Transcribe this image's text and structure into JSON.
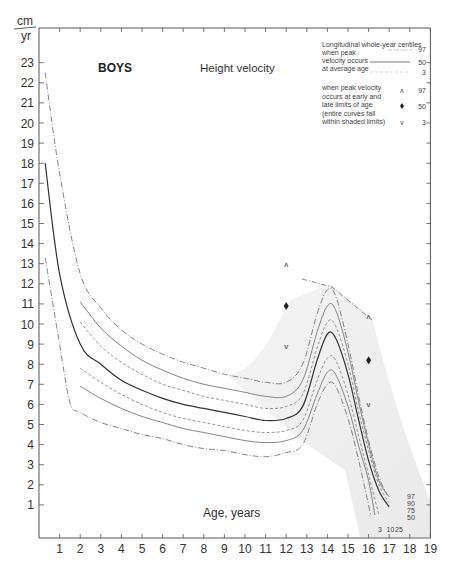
{
  "chart_data": {
    "type": "line",
    "title": "BOYS",
    "subtitle": "Height velocity",
    "xlabel": "Age, years",
    "ylabel_top": "cm",
    "ylabel_bottom": "yr",
    "xlim": [
      0,
      19
    ],
    "ylim": [
      0,
      23
    ],
    "x_ticks": [
      1,
      2,
      3,
      4,
      5,
      6,
      7,
      8,
      9,
      10,
      11,
      12,
      13,
      14,
      15,
      16,
      17,
      18,
      19
    ],
    "y_ticks": [
      1,
      2,
      3,
      4,
      5,
      6,
      7,
      8,
      9,
      10,
      11,
      12,
      13,
      14,
      15,
      16,
      17,
      18,
      19,
      20,
      21,
      22,
      23
    ],
    "grid": false,
    "legend": {
      "position": "top-right",
      "heading": "Longitudinal whole-year centiles",
      "group1_lines": [
        "when peak",
        "velocity occurs",
        "at average age"
      ],
      "group1_centiles": [
        "97",
        "50",
        "3"
      ],
      "group2_lines": [
        "when peak velocity",
        "occurs at early and",
        "late limits of age",
        "(entire curves fall",
        "within shaded limits)"
      ],
      "group2_markers": [
        {
          "symbol": "^",
          "centile": "97"
        },
        {
          "symbol": "♦",
          "centile": "50"
        },
        {
          "symbol": "v",
          "centile": "3"
        }
      ]
    },
    "curve_end_labels_right": [
      "97",
      "90",
      "75",
      "50"
    ],
    "curve_end_labels_bottom": [
      "3",
      "10",
      "25"
    ],
    "series": [
      {
        "name": "97th (average age)",
        "style": "dash-dot",
        "x": [
          0.3,
          1,
          2,
          3,
          4,
          5,
          6,
          7,
          8,
          9,
          10,
          11,
          12,
          12.8,
          13.5,
          14,
          14.4,
          15,
          15.5,
          16,
          16.5,
          16.9
        ],
        "y": [
          22.5,
          17.5,
          12.5,
          10.8,
          9.7,
          9.0,
          8.5,
          8.1,
          7.8,
          7.5,
          7.3,
          7.1,
          7.1,
          8.0,
          10.5,
          11.7,
          11.4,
          9.0,
          6.5,
          4.2,
          2.4,
          1.5
        ]
      },
      {
        "name": "90th",
        "style": "solid",
        "x": [
          2,
          3,
          4,
          5,
          6,
          7,
          8,
          9,
          10,
          11,
          12,
          12.8,
          13.5,
          14,
          14.4,
          15,
          15.5,
          16,
          16.5,
          17
        ],
        "y": [
          11.1,
          9.8,
          8.9,
          8.2,
          7.7,
          7.3,
          7.0,
          6.8,
          6.6,
          6.4,
          6.4,
          7.2,
          9.6,
          10.9,
          10.7,
          8.6,
          6.2,
          4.0,
          2.2,
          1.4
        ]
      },
      {
        "name": "75th",
        "style": "dashed",
        "x": [
          2,
          3,
          4,
          5,
          6,
          7,
          8,
          9,
          10,
          11,
          12,
          12.8,
          13.5,
          14,
          14.4,
          15,
          15.5,
          16,
          16.5,
          17
        ],
        "y": [
          10.1,
          8.9,
          8.1,
          7.5,
          7.0,
          6.7,
          6.4,
          6.2,
          6.0,
          5.8,
          5.9,
          6.5,
          8.8,
          10.1,
          9.9,
          8.0,
          5.7,
          3.7,
          2.0,
          1.1
        ]
      },
      {
        "name": "50th (average age)",
        "style": "solid-dark",
        "x": [
          0.3,
          1,
          2,
          3,
          4,
          5,
          6,
          7,
          8,
          9,
          10,
          11,
          12,
          12.8,
          13.5,
          14,
          14.4,
          15,
          15.5,
          16,
          16.5,
          17
        ],
        "y": [
          18.0,
          12.5,
          9.0,
          8.0,
          7.2,
          6.7,
          6.3,
          6.0,
          5.8,
          5.6,
          5.4,
          5.2,
          5.3,
          5.9,
          8.2,
          9.5,
          9.3,
          7.5,
          5.3,
          3.2,
          1.7,
          0.9
        ]
      },
      {
        "name": "25th",
        "style": "dashed",
        "x": [
          2,
          3,
          4,
          5,
          6,
          7,
          8,
          9,
          10,
          11,
          12,
          12.8,
          13.5,
          14,
          14.4,
          15,
          15.5,
          16,
          16.5
        ],
        "y": [
          7.8,
          7.1,
          6.5,
          6.0,
          5.6,
          5.3,
          5.1,
          4.9,
          4.7,
          4.6,
          4.7,
          5.2,
          7.2,
          8.3,
          8.2,
          6.5,
          4.5,
          2.5,
          0.5
        ]
      },
      {
        "name": "10th",
        "style": "solid",
        "x": [
          2,
          3,
          4,
          5,
          6,
          7,
          8,
          9,
          10,
          11,
          12,
          12.8,
          13.5,
          14,
          14.4,
          15,
          15.5,
          16,
          16.3
        ],
        "y": [
          6.9,
          6.3,
          5.8,
          5.4,
          5.1,
          4.8,
          4.6,
          4.4,
          4.2,
          4.1,
          4.2,
          4.7,
          6.5,
          7.6,
          7.5,
          5.9,
          4.0,
          2.2,
          0.5
        ]
      },
      {
        "name": "3rd (average age)",
        "style": "dash-dot",
        "x": [
          0.3,
          1,
          1.5,
          2,
          3,
          4,
          5,
          6,
          7,
          8,
          9,
          10,
          11,
          12,
          12.8,
          13.5,
          14,
          14.4,
          15,
          15.5,
          16.1
        ],
        "y": [
          13.3,
          9.0,
          6.1,
          5.6,
          5.1,
          4.8,
          4.5,
          4.3,
          4.0,
          3.8,
          3.7,
          3.5,
          3.4,
          3.6,
          4.0,
          6.0,
          7.0,
          6.9,
          5.3,
          3.3,
          0.5
        ]
      }
    ],
    "markers": [
      {
        "age": 12,
        "value": 13.0,
        "symbol": "^",
        "centile": "97",
        "limit": "early"
      },
      {
        "age": 12,
        "value": 10.9,
        "symbol": "♦",
        "centile": "50",
        "limit": "early"
      },
      {
        "age": 12,
        "value": 8.9,
        "symbol": "v",
        "centile": "3",
        "limit": "early"
      },
      {
        "age": 16,
        "value": 10.4,
        "symbol": "^",
        "centile": "97",
        "limit": "late"
      },
      {
        "age": 16,
        "value": 8.2,
        "symbol": "♦",
        "centile": "50",
        "limit": "late"
      },
      {
        "age": 16,
        "value": 6.0,
        "symbol": "v",
        "centile": "3",
        "limit": "late"
      }
    ]
  }
}
